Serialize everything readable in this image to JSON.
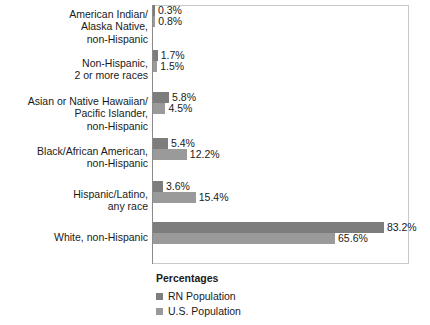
{
  "chart_data": {
    "type": "bar",
    "orientation": "horizontal",
    "title": "",
    "xlabel": "",
    "ylabel": "",
    "legend_title": "Percentages",
    "legend_position": "bottom",
    "grid": false,
    "xlim": [
      0,
      92
    ],
    "categories": [
      "American Indian/\nAlaska Native,\nnon-Hispanic",
      "Non-Hispanic,\n2 or more races",
      "Asian or Native Hawaiian/\nPacific Islander,\nnon-Hispanic",
      "Black/African American,\nnon-Hispanic",
      "Hispanic/Latino,\nany race",
      "White, non-Hispanic"
    ],
    "series": [
      {
        "name": "RN Population",
        "color": "#7d7d7d",
        "values": [
          0.3,
          1.7,
          5.8,
          5.4,
          3.6,
          83.2
        ],
        "labels": [
          "0.3%",
          "1.7%",
          "5.8%",
          "5.4%",
          "3.6%",
          "83.2%"
        ]
      },
      {
        "name": "U.S. Population",
        "color": "#9a9a9a",
        "values": [
          0.8,
          1.5,
          4.5,
          12.2,
          15.4,
          65.6
        ],
        "labels": [
          "0.8%",
          "1.5%",
          "4.5%",
          "12.2%",
          "15.4%",
          "65.6%"
        ]
      }
    ]
  },
  "legend": {
    "title": "Percentages",
    "items": [
      {
        "label": "RN Population",
        "color": "#7d7d7d"
      },
      {
        "label": "U.S. Population",
        "color": "#9a9a9a"
      }
    ]
  }
}
